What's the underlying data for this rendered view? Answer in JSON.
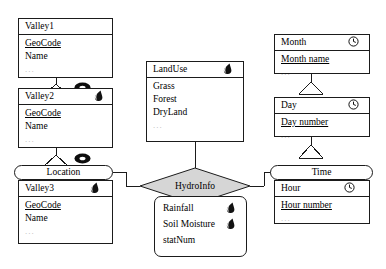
{
  "diagram": {
    "fill_gray": "#d6d6d6",
    "line_color": "#1b1b1b"
  },
  "entities": {
    "valley1": {
      "name": "Valley1",
      "attributes": [
        {
          "label": "GeoCode",
          "key": true
        },
        {
          "label": "Name",
          "key": false
        },
        {
          "label": "...",
          "key": false
        }
      ],
      "icon": ""
    },
    "valley2": {
      "name": "Valley2",
      "attributes": [
        {
          "label": "GeoCode",
          "key": true
        },
        {
          "label": "Name",
          "key": false
        },
        {
          "label": "...",
          "key": false
        }
      ],
      "icon": "leaf-icon"
    },
    "valley3": {
      "tab_label": "Location",
      "name": "Valley3",
      "attributes": [
        {
          "label": "GeoCode",
          "key": true
        },
        {
          "label": "Name",
          "key": false
        },
        {
          "label": "...",
          "key": false
        }
      ],
      "icon": "leaf-icon"
    },
    "landuse": {
      "name": "LandUse",
      "attributes": [
        {
          "label": "Grass",
          "key": false
        },
        {
          "label": "Forest",
          "key": false
        },
        {
          "label": "DryLand",
          "key": false
        },
        {
          "label": "...",
          "key": false
        }
      ],
      "icon": "leaf-icon"
    },
    "month": {
      "name": "Month",
      "attributes": [
        {
          "label": "Month name",
          "key": true
        },
        {
          "label": "...",
          "key": false
        }
      ],
      "icon": "clock-icon"
    },
    "day": {
      "name": "Day",
      "attributes": [
        {
          "label": "Day number",
          "key": true
        },
        {
          "label": "...",
          "key": false
        }
      ],
      "icon": "clock-icon"
    },
    "hour": {
      "tab_label": "Time",
      "name": "Hour",
      "attributes": [
        {
          "label": "Hour number",
          "key": true
        },
        {
          "label": "...",
          "key": false
        }
      ],
      "icon": "clock-icon"
    }
  },
  "relationship": {
    "name": "HydroInfo",
    "attributes": [
      {
        "label": "Rainfall",
        "icon": "leaf-icon"
      },
      {
        "label": "Soil Moisture",
        "icon": "leaf-icon"
      },
      {
        "label": "statNum",
        "icon": ""
      }
    ]
  },
  "icons": {
    "oval_between_valley1_valley2": "oval-icon",
    "oval_between_valley2_location": "oval-icon"
  }
}
